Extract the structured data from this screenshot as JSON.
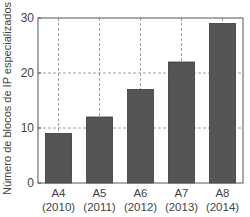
{
  "chart_data": {
    "type": "bar",
    "title": "",
    "xlabel": "",
    "ylabel": "Número de blocos de IP especializados",
    "categories": [
      "A4\n(2010)",
      "A5\n(2011)",
      "A6\n(2012)",
      "A7\n(2013)",
      "A8\n(2014)"
    ],
    "category_lines": [
      [
        "A4",
        "(2010)"
      ],
      [
        "A5",
        "(2011)"
      ],
      [
        "A6",
        "(2012)"
      ],
      [
        "A7",
        "(2013)"
      ],
      [
        "A8",
        "(2014)"
      ]
    ],
    "values": [
      9,
      12,
      17,
      22,
      29
    ],
    "ylim": [
      0,
      30
    ],
    "yticks": [
      0,
      10,
      20,
      30
    ],
    "grid": true,
    "grid_style": "dashed",
    "legend": null,
    "bar_color": "#555555"
  }
}
